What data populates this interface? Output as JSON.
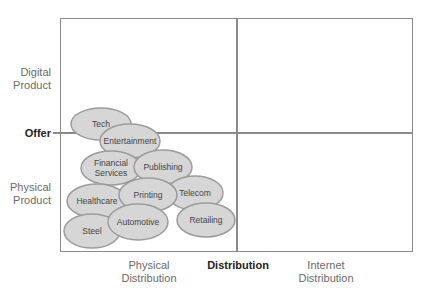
{
  "diagram": {
    "y_axis": {
      "title": "Offer",
      "top_label": [
        "Digital",
        "Product"
      ],
      "bottom_label": [
        "Physical",
        "Product"
      ]
    },
    "x_axis": {
      "title": "Distribution",
      "left_label": [
        "Physical",
        "Distribution"
      ],
      "right_label": [
        "Internet",
        "Distribution"
      ]
    },
    "colors": {
      "frame": "#8a8a8a",
      "bubble_fill": "#d6d6d6",
      "bubble_stroke": "#9c9c9c",
      "label_text": "#6a6a6a",
      "axis_title": "#222222"
    },
    "bubbles": [
      {
        "label": [
          "Tech"
        ],
        "cx": 101,
        "cy": 124,
        "rx": 30,
        "ry": 16
      },
      {
        "label": [
          "Entertainment"
        ],
        "cx": 130,
        "cy": 141,
        "rx": 30,
        "ry": 17
      },
      {
        "label": [
          "Financial",
          "Services"
        ],
        "cx": 111,
        "cy": 168,
        "rx": 30,
        "ry": 17
      },
      {
        "label": [
          "Publishing"
        ],
        "cx": 163,
        "cy": 167,
        "rx": 29,
        "ry": 17
      },
      {
        "label": [
          "Telecom"
        ],
        "cx": 195,
        "cy": 193,
        "rx": 28,
        "ry": 17
      },
      {
        "label": [
          "Healthcare"
        ],
        "cx": 97,
        "cy": 201,
        "rx": 30,
        "ry": 17
      },
      {
        "label": [
          "Printing"
        ],
        "cx": 148,
        "cy": 195,
        "rx": 29,
        "ry": 17
      },
      {
        "label": [
          "Retailing"
        ],
        "cx": 206,
        "cy": 220,
        "rx": 29,
        "ry": 17
      },
      {
        "label": [
          "Steel"
        ],
        "cx": 92,
        "cy": 231,
        "rx": 28,
        "ry": 17
      },
      {
        "label": [
          "Automotive"
        ],
        "cx": 138,
        "cy": 222,
        "rx": 30,
        "ry": 18
      }
    ]
  }
}
